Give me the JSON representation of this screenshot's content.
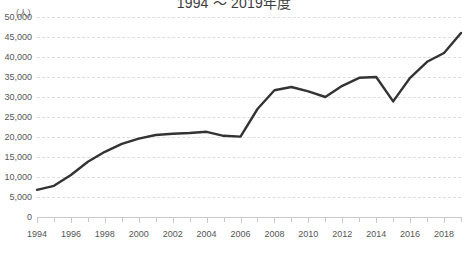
{
  "chart_data": {
    "type": "line",
    "title": "1994 ～ 2019年度",
    "ylabel": "(人)",
    "xlabel": "",
    "ylim": [
      0,
      50000
    ],
    "ytick_labels": [
      "50,000",
      "45,000",
      "40,000",
      "35,000",
      "30,000",
      "25,000",
      "20,000",
      "15,000",
      "10,000",
      "5,000",
      "0"
    ],
    "ytick_values": [
      50000,
      45000,
      40000,
      35000,
      30000,
      25000,
      20000,
      15000,
      10000,
      5000,
      0
    ],
    "xtick_labels": [
      "1994",
      "1996",
      "1998",
      "2000",
      "2002",
      "2004",
      "2006",
      "2008",
      "2010",
      "2012",
      "2014",
      "2016",
      "2018"
    ],
    "x": [
      1994,
      1995,
      1996,
      1997,
      1998,
      1999,
      2000,
      2001,
      2002,
      2003,
      2004,
      2005,
      2006,
      2007,
      2008,
      2009,
      2010,
      2011,
      2012,
      2013,
      2014,
      2015,
      2016,
      2017,
      2018,
      2019
    ],
    "xlim": [
      1994,
      2019
    ],
    "series": [
      {
        "name": "人数",
        "color": "#333333",
        "values": [
          6800,
          7800,
          10500,
          13800,
          16300,
          18300,
          19600,
          20500,
          20800,
          21000,
          21300,
          20300,
          20100,
          27000,
          31700,
          32500,
          31400,
          30000,
          32800,
          34800,
          35000,
          28900,
          34800,
          38800,
          41000,
          46000
        ]
      }
    ],
    "grid": true,
    "grid_style": "dashed-horizontal",
    "legend": "none",
    "line_width": 2.4
  }
}
